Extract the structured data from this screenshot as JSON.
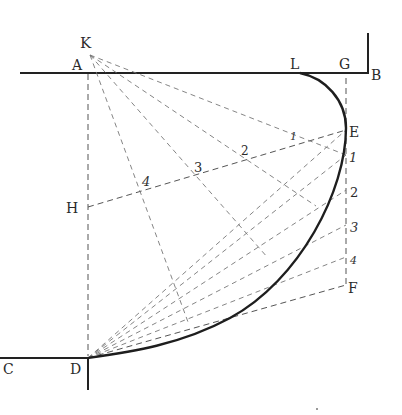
{
  "figure": {
    "title": "",
    "points": {
      "K": {
        "label": "K",
        "x": 90,
        "y": 55
      },
      "A": {
        "label": "A",
        "x": 88,
        "y": 73
      },
      "L": {
        "label": "L",
        "x": 305,
        "y": 73
      },
      "G": {
        "label": "G",
        "x": 346,
        "y": 73
      },
      "B": {
        "label": "B",
        "x": 368,
        "y": 73
      },
      "E": {
        "label": "E",
        "x": 346,
        "y": 130
      },
      "H": {
        "label": "H",
        "x": 88,
        "y": 207
      },
      "F": {
        "label": "F",
        "x": 346,
        "y": 285
      },
      "C": {
        "label": "C",
        "x": 0,
        "y": 358
      },
      "D": {
        "label": "D",
        "x": 88,
        "y": 358
      }
    },
    "gf_divisions": [
      {
        "label": "1",
        "x": 346,
        "y": 155
      },
      {
        "label": "2",
        "x": 346,
        "y": 190
      },
      {
        "label": "3",
        "x": 346,
        "y": 225
      },
      {
        "label": "4",
        "x": 346,
        "y": 257
      }
    ],
    "he_divisions": [
      {
        "label": "1",
        "x": 292,
        "y": 141
      },
      {
        "label": "2",
        "x": 244,
        "y": 156
      },
      {
        "label": "3",
        "x": 195,
        "y": 170
      },
      {
        "label": "4",
        "x": 145,
        "y": 185
      }
    ],
    "labels": {
      "K": "K",
      "A": "A",
      "L": "L",
      "G": "G",
      "B": "B",
      "E": "E",
      "H": "H",
      "F": "F",
      "C": "C",
      "D": "D",
      "gf1": "1",
      "gf2": "2",
      "gf3": "3",
      "gf4": "4",
      "he1": "1",
      "he2": "2",
      "he3": "3",
      "he4": "4"
    }
  }
}
